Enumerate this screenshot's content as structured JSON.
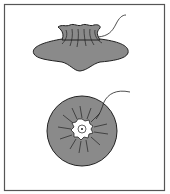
{
  "figure": {
    "colors": {
      "background": "#ffffff",
      "frame": "#555555",
      "fill": "#8a8a8a",
      "outline": "#222222",
      "center": "#ffffff"
    },
    "views": [
      {
        "name": "side-view",
        "label": ""
      },
      {
        "name": "top-view",
        "label": ""
      }
    ]
  }
}
